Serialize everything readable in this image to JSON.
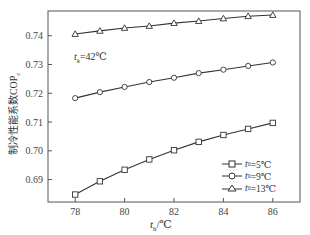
{
  "chart_data": {
    "type": "line",
    "title": "",
    "xlabel": "t_h/℃",
    "ylabel": "制冷性能系数COP_c",
    "x": [
      78,
      79,
      80,
      81,
      82,
      83,
      84,
      85,
      86
    ],
    "xticks": [
      78,
      80,
      82,
      84,
      86
    ],
    "yticks": [
      0.69,
      0.7,
      0.71,
      0.72,
      0.73,
      0.74
    ],
    "xlim": [
      76.9,
      87.1
    ],
    "ylim": [
      0.6822,
      0.7486
    ],
    "grid": false,
    "legend_position": "lower right",
    "annotation": "t_k=42℃",
    "series": [
      {
        "name": "t_0=5℃",
        "marker": "square",
        "values": [
          0.6848,
          0.6894,
          0.6934,
          0.697,
          0.7002,
          0.7031,
          0.7055,
          0.7076,
          0.7097
        ]
      },
      {
        "name": "t_0=9℃",
        "marker": "circle",
        "values": [
          0.7183,
          0.7204,
          0.7222,
          0.7239,
          0.7254,
          0.727,
          0.7282,
          0.7295,
          0.7307
        ]
      },
      {
        "name": "t_0=13℃",
        "marker": "triangle",
        "values": [
          0.7406,
          0.7417,
          0.7427,
          0.7434,
          0.7444,
          0.7451,
          0.746,
          0.7468,
          0.7472
        ]
      }
    ]
  },
  "labels": {
    "ylabel_main": "制冷性能系数COP",
    "ylabel_sub": "c",
    "xlabel_var": "t",
    "xlabel_sub": "h",
    "xlabel_unit": "/℃",
    "annot_var": "t",
    "annot_sub": "k",
    "annot_rest": "=42℃",
    "legend": [
      {
        "var": "t",
        "sub": "0",
        "rest": "=5℃"
      },
      {
        "var": "t",
        "sub": "0",
        "rest": "=9℃"
      },
      {
        "var": "t",
        "sub": "0",
        "rest": "=13℃"
      }
    ]
  }
}
